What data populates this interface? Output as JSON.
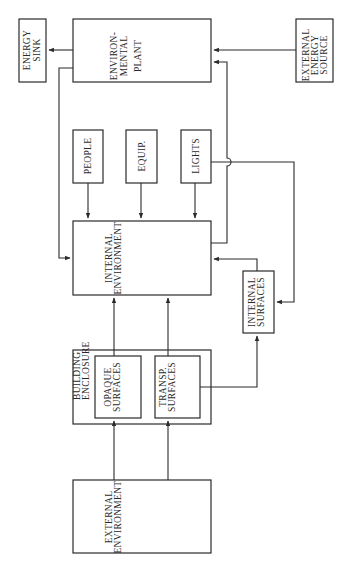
{
  "diagram": {
    "orientation": "rotated-90-ccw",
    "nodes": {
      "energy_sink": {
        "lines": [
          "ENERGY",
          "SINK"
        ]
      },
      "environmental_plant": {
        "lines": [
          "ENVIRON-",
          "MENTAL",
          "PLANT"
        ]
      },
      "external_energy_source": {
        "lines": [
          "EXTERNAL",
          "ENERGY",
          "SOURCE"
        ]
      },
      "people": {
        "lines": [
          "PEOPLE"
        ]
      },
      "equipment": {
        "lines": [
          "EQUIP."
        ]
      },
      "lights": {
        "lines": [
          "LIGHTS"
        ]
      },
      "internal_environment": {
        "lines": [
          "INTERNAL",
          "ENVIRONMENT"
        ]
      },
      "internal_surfaces": {
        "lines": [
          "INTERNAL",
          "SURFACES"
        ]
      },
      "building_enclosure": {
        "lines": [
          "BUILDING",
          "ENCLOSURE"
        ]
      },
      "opaque_surfaces": {
        "lines": [
          "OPAQUE",
          "SURFACES"
        ]
      },
      "transparent_surfaces": {
        "lines": [
          "TRANSP.",
          "SURFACES"
        ]
      },
      "external_environment": {
        "lines": [
          "EXTERNAL",
          "ENVIRONMENT"
        ]
      }
    },
    "edges": [
      {
        "from": "environmental_plant",
        "to": "energy_sink"
      },
      {
        "from": "external_energy_source",
        "to": "environmental_plant"
      },
      {
        "from": "environmental_plant",
        "to": "internal_environment"
      },
      {
        "from": "internal_environment",
        "to": "environmental_plant"
      },
      {
        "from": "people",
        "to": "internal_environment"
      },
      {
        "from": "equipment",
        "to": "internal_environment"
      },
      {
        "from": "lights",
        "to": "internal_environment"
      },
      {
        "from": "lights",
        "to": "internal_surfaces"
      },
      {
        "from": "internal_surfaces",
        "to": "internal_environment"
      },
      {
        "from": "opaque_surfaces",
        "to": "internal_environment"
      },
      {
        "from": "transparent_surfaces",
        "to": "internal_environment"
      },
      {
        "from": "transparent_surfaces",
        "to": "internal_surfaces"
      },
      {
        "from": "external_environment",
        "to": "opaque_surfaces"
      },
      {
        "from": "external_environment",
        "to": "transparent_surfaces"
      }
    ]
  }
}
